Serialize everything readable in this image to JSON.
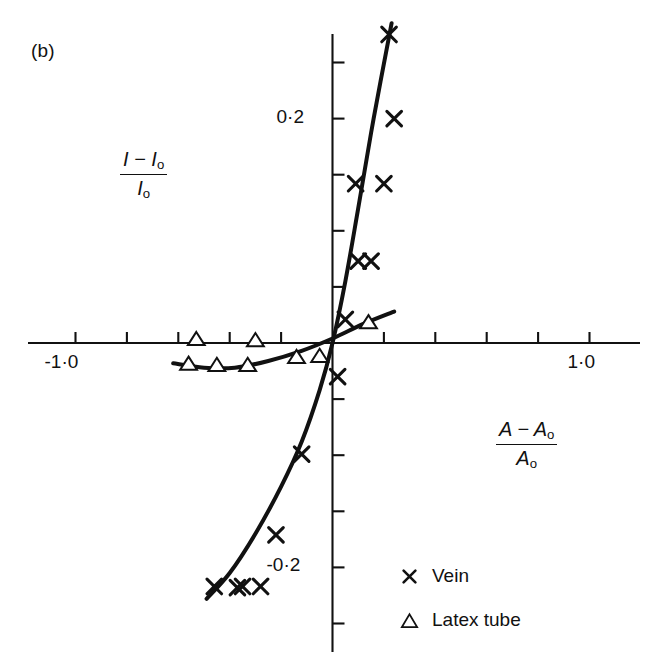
{
  "figure": {
    "panel_label": "(b)",
    "background": "#ffffff",
    "ink_color": "#111111"
  },
  "chart_data": {
    "type": "scatter",
    "title": "",
    "subtitle": "",
    "xlabel": "(A − A₀) / A₀",
    "ylabel": "(I − I₀) / I₀",
    "xlabel_parts": {
      "numerator": "A − A",
      "numerator_sub": "o",
      "denominator": "A",
      "denominator_sub": "o"
    },
    "ylabel_parts": {
      "numerator": "I − I",
      "numerator_sub": "o",
      "denominator": "I",
      "denominator_sub": "o"
    },
    "xlim": [
      -1.3,
      1.3
    ],
    "ylim": [
      -0.31,
      0.31
    ],
    "grid": false,
    "legend_position": "bottom-right",
    "axis_style": "crossed-at-origin",
    "xticklabels": [
      "-1·0",
      "1·0"
    ],
    "xticklabel_values": [
      -1.0,
      1.0
    ],
    "yticklabels": [
      "0·2",
      "-0·2"
    ],
    "yticklabel_values": [
      0.2,
      -0.2
    ],
    "xtick_values": [
      -1.0,
      -0.8,
      -0.6,
      -0.4,
      -0.2,
      0.2,
      0.4,
      0.6,
      0.8,
      1.0
    ],
    "ytick_values": [
      0.25,
      0.2,
      0.15,
      0.1,
      0.05,
      -0.05,
      -0.1,
      -0.15,
      -0.2,
      -0.25
    ],
    "series": [
      {
        "name": "Vein",
        "marker": "x",
        "color": "#111111",
        "points": [
          {
            "x": 0.22,
            "y": 0.275
          },
          {
            "x": 0.24,
            "y": 0.2
          },
          {
            "x": 0.09,
            "y": 0.142
          },
          {
            "x": 0.2,
            "y": 0.142
          },
          {
            "x": 0.1,
            "y": 0.073
          },
          {
            "x": 0.15,
            "y": 0.073
          },
          {
            "x": 0.05,
            "y": 0.021
          },
          {
            "x": 0.02,
            "y": -0.03
          },
          {
            "x": -0.12,
            "y": -0.099
          },
          {
            "x": -0.22,
            "y": -0.171
          },
          {
            "x": -0.28,
            "y": -0.217
          },
          {
            "x": -0.35,
            "y": -0.217
          },
          {
            "x": -0.37,
            "y": -0.218
          },
          {
            "x": -0.46,
            "y": -0.217
          }
        ]
      },
      {
        "name": "Latex tube",
        "marker": "triangle",
        "color": "#111111",
        "points": [
          {
            "x": 0.14,
            "y": 0.018
          },
          {
            "x": -0.05,
            "y": -0.012
          },
          {
            "x": -0.14,
            "y": -0.013
          },
          {
            "x": -0.33,
            "y": -0.02
          },
          {
            "x": -0.45,
            "y": -0.02
          },
          {
            "x": -0.56,
            "y": -0.019
          },
          {
            "x": -0.3,
            "y": 0.002
          },
          {
            "x": -0.53,
            "y": 0.003
          }
        ]
      }
    ],
    "fitted_curves": [
      {
        "name": "vein-curve",
        "series": "Vein",
        "description": "steep sigmoid rising through origin",
        "path_points": [
          {
            "x": -0.49,
            "y": -0.228
          },
          {
            "x": -0.4,
            "y": -0.205
          },
          {
            "x": -0.3,
            "y": -0.17
          },
          {
            "x": -0.2,
            "y": -0.128
          },
          {
            "x": -0.12,
            "y": -0.088
          },
          {
            "x": -0.05,
            "y": -0.042
          },
          {
            "x": 0.0,
            "y": 0.0
          },
          {
            "x": 0.05,
            "y": 0.055
          },
          {
            "x": 0.1,
            "y": 0.12
          },
          {
            "x": 0.16,
            "y": 0.2
          },
          {
            "x": 0.23,
            "y": 0.285
          }
        ]
      },
      {
        "name": "latex-curve",
        "series": "Latex tube",
        "description": "shallow near-flat curve rising slowly to the right",
        "path_points": [
          {
            "x": -0.62,
            "y": -0.018
          },
          {
            "x": -0.5,
            "y": -0.022
          },
          {
            "x": -0.38,
            "y": -0.022
          },
          {
            "x": -0.25,
            "y": -0.016
          },
          {
            "x": -0.12,
            "y": -0.007
          },
          {
            "x": 0.0,
            "y": 0.004
          },
          {
            "x": 0.12,
            "y": 0.017
          },
          {
            "x": 0.24,
            "y": 0.028
          }
        ]
      }
    ],
    "legend": [
      {
        "label": "Vein",
        "marker": "x"
      },
      {
        "label": "Latex tube",
        "marker": "triangle"
      }
    ]
  }
}
